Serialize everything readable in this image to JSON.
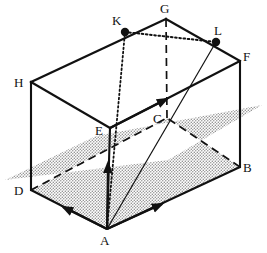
{
  "figure": {
    "type": "geometry-diagram",
    "stroke_color": "#111111",
    "shade_color": "#9a9a9a",
    "background": "#ffffff"
  },
  "vertices": [
    {
      "id": "A",
      "label": "A",
      "x": 107,
      "y": 229,
      "label_x": 100,
      "label_y": 234,
      "dot": false
    },
    {
      "id": "B",
      "label": "B",
      "x": 240,
      "y": 167,
      "label_x": 243,
      "label_y": 161,
      "dot": false
    },
    {
      "id": "C",
      "label": "C",
      "x": 167,
      "y": 118,
      "label_x": 153,
      "label_y": 112,
      "dot": false
    },
    {
      "id": "D",
      "label": "D",
      "x": 31,
      "y": 190,
      "label_x": 14,
      "label_y": 184,
      "dot": false
    },
    {
      "id": "E",
      "label": "E",
      "x": 110,
      "y": 128,
      "label_x": 95,
      "label_y": 124,
      "dot": false
    },
    {
      "id": "F",
      "label": "F",
      "x": 240,
      "y": 61,
      "label_x": 243,
      "label_y": 50,
      "dot": false
    },
    {
      "id": "G",
      "label": "G",
      "x": 166,
      "y": 19,
      "label_x": 160,
      "label_y": 2,
      "dot": false
    },
    {
      "id": "H",
      "label": "H",
      "x": 31,
      "y": 82,
      "label_x": 14,
      "label_y": 76,
      "dot": false
    },
    {
      "id": "K",
      "label": "K",
      "x": 125,
      "y": 32,
      "label_x": 112,
      "label_y": 14,
      "dot": true
    },
    {
      "id": "L",
      "label": "L",
      "x": 216,
      "y": 42,
      "label_x": 214,
      "label_y": 24,
      "dot": true
    }
  ],
  "edges": [
    {
      "from": "A",
      "to": "D",
      "style": "solid",
      "arrow": "mid-forward"
    },
    {
      "from": "A",
      "to": "B",
      "style": "solid",
      "arrow": "mid-forward"
    },
    {
      "from": "A",
      "to": "E",
      "style": "solid",
      "arrow": "mid-forward"
    },
    {
      "from": "D",
      "to": "H",
      "style": "solid",
      "arrow": "none"
    },
    {
      "from": "B",
      "to": "F",
      "style": "solid",
      "arrow": "none"
    },
    {
      "from": "D",
      "to": "C",
      "style": "dashed",
      "arrow": "none"
    },
    {
      "from": "B",
      "to": "C",
      "style": "dashed",
      "arrow": "none"
    },
    {
      "from": "C",
      "to": "G",
      "style": "dashed",
      "arrow": "none"
    },
    {
      "from": "E",
      "to": "H",
      "style": "solid",
      "arrow": "none"
    },
    {
      "from": "E",
      "to": "F",
      "style": "solid",
      "arrow": "mid-forward"
    },
    {
      "from": "H",
      "to": "G",
      "style": "solid",
      "arrow": "none"
    },
    {
      "from": "G",
      "to": "F",
      "style": "solid",
      "arrow": "none"
    }
  ],
  "construction_lines": [
    {
      "from": "K",
      "to": "L",
      "style": "dotted",
      "note": "segment-KL-on-top-face"
    },
    {
      "from": "A",
      "to": "K",
      "style": "dotted",
      "note": "line-A-to-K"
    },
    {
      "from": "A",
      "to": "L",
      "style": "solid-thin",
      "note": "line-A-to-L"
    },
    {
      "from": "E",
      "to": "L",
      "style": "solid-thin",
      "note": "line-E-to-L"
    }
  ],
  "shaded_plane": {
    "name": "horizontal-cutting-plane",
    "fill": "stipple",
    "points": "5,180 96,136 262,105 168,160"
  }
}
